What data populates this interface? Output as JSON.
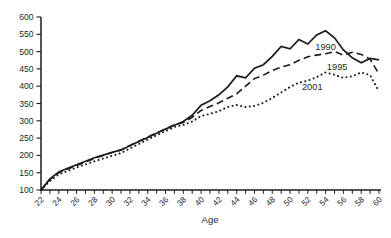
{
  "figure": {
    "kind": "scanned line chart, grayscale, no title, inline series annotations"
  },
  "colors": {
    "background": "#ffffff",
    "axis": "#1c1c1c",
    "line": "#1a1a1a",
    "label_text": "#1f1f1f"
  },
  "chart_data": {
    "type": "line",
    "xlabel": "Age",
    "ylabel": "",
    "xlim": [
      22,
      60
    ],
    "ylim": [
      100,
      600
    ],
    "yticks": [
      100,
      150,
      200,
      250,
      300,
      350,
      400,
      450,
      500,
      550,
      600
    ],
    "xticks_minor_every": 1,
    "xticks_labeled_every": 2,
    "grid": false,
    "legend_position": "inline-annotations",
    "x": [
      22,
      23,
      24,
      25,
      26,
      27,
      28,
      29,
      30,
      31,
      32,
      33,
      34,
      35,
      36,
      37,
      38,
      39,
      40,
      41,
      42,
      43,
      44,
      45,
      46,
      47,
      48,
      49,
      50,
      51,
      52,
      53,
      54,
      55,
      56,
      57,
      58,
      59,
      60
    ],
    "series": [
      {
        "name": "1990",
        "style": "solid",
        "values": [
          100,
          132,
          152,
          163,
          173,
          183,
          193,
          201,
          209,
          216,
          228,
          240,
          252,
          264,
          276,
          287,
          298,
          316,
          345,
          358,
          375,
          398,
          430,
          424,
          452,
          462,
          486,
          515,
          508,
          535,
          522,
          548,
          560,
          540,
          505,
          482,
          468,
          480,
          476
        ]
      },
      {
        "name": "1995",
        "style": "dashed",
        "values": [
          100,
          130,
          150,
          161,
          171,
          181,
          191,
          200,
          208,
          216,
          229,
          241,
          253,
          265,
          277,
          288,
          295,
          310,
          330,
          341,
          352,
          365,
          378,
          400,
          422,
          432,
          445,
          455,
          462,
          475,
          485,
          490,
          494,
          500,
          490,
          498,
          492,
          478,
          435
        ]
      },
      {
        "name": "2001",
        "style": "dotted",
        "values": [
          100,
          126,
          145,
          155,
          165,
          174,
          183,
          191,
          199,
          207,
          220,
          233,
          246,
          258,
          270,
          282,
          288,
          298,
          314,
          320,
          328,
          340,
          346,
          340,
          343,
          352,
          366,
          382,
          398,
          410,
          416,
          426,
          440,
          433,
          424,
          429,
          440,
          432,
          385
        ]
      }
    ],
    "annotations": [
      {
        "text": "1990",
        "age": 54.0,
        "value": 514
      },
      {
        "text": "1995",
        "age": 55.3,
        "value": 456
      },
      {
        "text": "2001",
        "age": 52.5,
        "value": 398
      }
    ]
  }
}
